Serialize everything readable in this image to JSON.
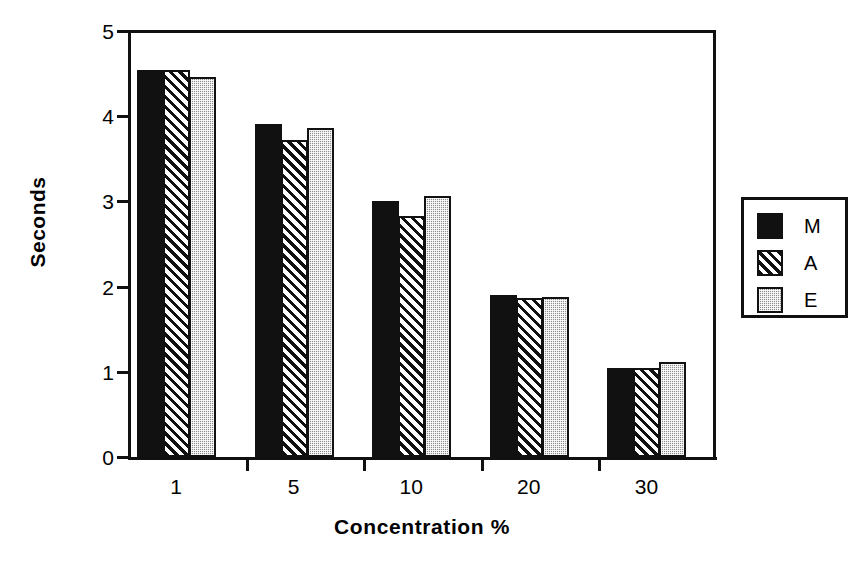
{
  "chart_data": {
    "type": "bar",
    "title": "",
    "xlabel": "Concentration %",
    "ylabel": "Seconds",
    "categories": [
      "1",
      "5",
      "10",
      "20",
      "30"
    ],
    "series": [
      {
        "name": "M",
        "fill": "solid-black",
        "values": [
          4.54,
          3.91,
          3.0,
          1.9,
          1.04
        ]
      },
      {
        "name": "A",
        "fill": "diagonal-hatch",
        "values": [
          4.54,
          3.72,
          2.83,
          1.87,
          1.05
        ]
      },
      {
        "name": "E",
        "fill": "gray-dotted",
        "values": [
          4.46,
          3.86,
          3.06,
          1.88,
          1.11
        ]
      }
    ],
    "ylim": [
      0,
      5
    ],
    "yticks": [
      "0",
      "1",
      "2",
      "3",
      "4",
      "5"
    ],
    "xticks": [
      "1",
      "5",
      "10",
      "20",
      "30"
    ],
    "grid": false,
    "legend_position": "right-outside",
    "legend_entries": [
      "M",
      "A",
      "E"
    ],
    "colors": {
      "axis": "#111111",
      "series_M": "#111111",
      "series_A": "#ffffff",
      "series_E": "#8d8d8d",
      "background": "#ffffff"
    }
  }
}
